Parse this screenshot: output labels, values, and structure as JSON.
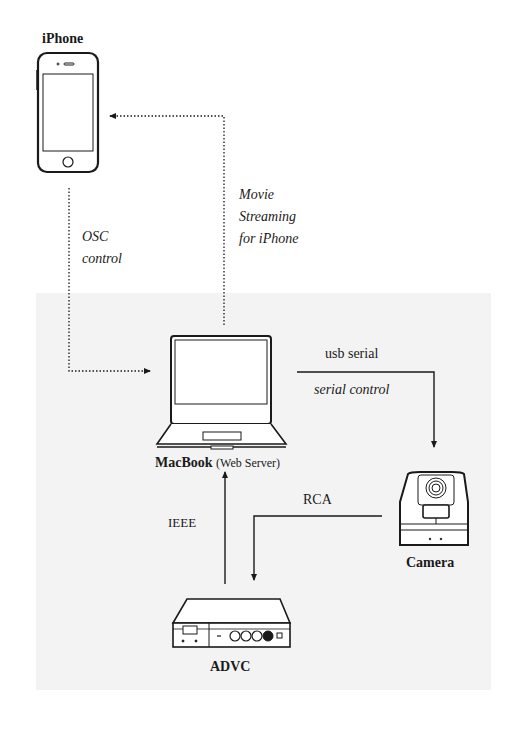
{
  "diagram": {
    "title": "",
    "nodes": {
      "iphone": {
        "label": "iPhone"
      },
      "macbook": {
        "label": "MacBook",
        "sublabel": "(Web Server)"
      },
      "camera": {
        "label": "Camera"
      },
      "advc": {
        "label": "ADVC"
      }
    },
    "edges": {
      "osc": {
        "label_line1": "OSC",
        "label_line2": "control",
        "style": "dotted",
        "from": "iPhone",
        "to": "MacBook"
      },
      "movie": {
        "label_line1": "Movie",
        "label_line2": "Streaming",
        "label_line3": "for iPhone",
        "style": "dotted",
        "from": "MacBook",
        "to": "iPhone"
      },
      "usb": {
        "label_top": "usb serial",
        "label_bottom": "serial control",
        "style": "solid",
        "from": "MacBook",
        "to": "Camera"
      },
      "rca": {
        "label": "RCA",
        "style": "solid",
        "from": "Camera",
        "to": "ADVC"
      },
      "ieee": {
        "label": "IEEE",
        "style": "solid",
        "from": "ADVC",
        "to": "MacBook"
      }
    },
    "colors": {
      "panel": "#f3f3f3",
      "ink": "#1a1a1a",
      "background": "#ffffff"
    }
  }
}
